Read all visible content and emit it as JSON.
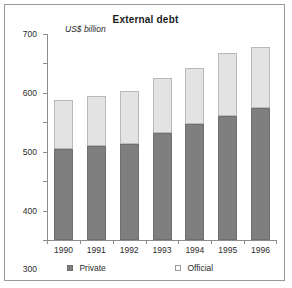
{
  "chart_data": {
    "type": "bar",
    "subtype": "stacked-column",
    "title": "External debt",
    "ylabel": "US$ billion",
    "xlabel": "",
    "ylim": [
      0,
      700
    ],
    "yticks": [
      0,
      100,
      200,
      300,
      400,
      500,
      600,
      700
    ],
    "ytick_labels": [
      "0",
      "100",
      "200",
      "300",
      "400",
      "500",
      "600",
      "700"
    ],
    "grid": false,
    "legend_position": "bottom",
    "categories": [
      "1990",
      "1991",
      "1992",
      "1993",
      "1994",
      "1995",
      "1996"
    ],
    "series": [
      {
        "name": "Private",
        "color": "#7f7f7f",
        "values": [
          310,
          318,
          325,
          365,
          395,
          420,
          450
        ]
      },
      {
        "name": "Official",
        "color": "#e3e3e3",
        "values": [
          165,
          172,
          180,
          185,
          188,
          215,
          205
        ]
      }
    ],
    "totals": [
      475,
      490,
      505,
      550,
      583,
      635,
      655
    ]
  },
  "legend": {
    "items": [
      {
        "label": "Private",
        "swatch": "filled-dark-square-icon"
      },
      {
        "label": "Official",
        "swatch": "empty-light-square-icon"
      }
    ]
  }
}
